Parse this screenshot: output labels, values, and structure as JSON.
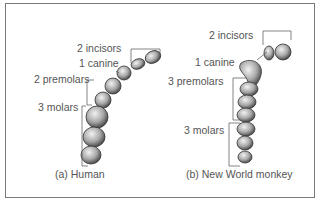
{
  "panel_a": {
    "caption": "(a) Human",
    "labels": {
      "incisors": "2 incisors",
      "canine": "1 canine",
      "premolars": "2 premolars",
      "molars": "3 molars"
    }
  },
  "panel_b": {
    "caption": "(b) New World monkey",
    "labels": {
      "incisors": "2 incisors",
      "canine": "1 canine",
      "premolars": "3 premolars",
      "molars": "3 molars"
    }
  },
  "colors": {
    "border": "#7a7a7a",
    "text": "#555555",
    "line": "#666666",
    "tooth_fill": "#d9d9d9",
    "tooth_shade": "#555555"
  }
}
